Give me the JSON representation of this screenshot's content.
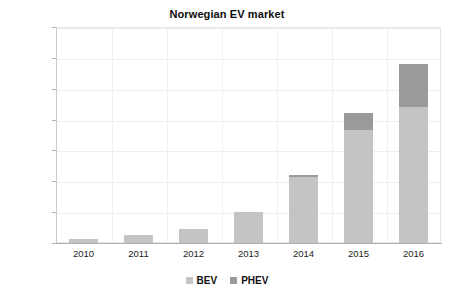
{
  "chart_data": {
    "type": "bar",
    "title": "Norwegian EV market",
    "xlabel": "",
    "ylabel": "",
    "categories": [
      "2010",
      "2011",
      "2012",
      "2013",
      "2014",
      "2015",
      "2016"
    ],
    "series": [
      {
        "name": "BEV",
        "color": "#c4c4c4",
        "values": [
          2900,
          5000,
          9000,
          19800,
          42500,
          73000,
          88000
        ]
      },
      {
        "name": "PHEV",
        "color": "#9a9a9a",
        "values": [
          0,
          0,
          0,
          200,
          1500,
          11000,
          28000
        ]
      }
    ],
    "stacked": true,
    "ylim": [
      0,
      140000
    ],
    "yticks": [
      0,
      20000,
      40000,
      60000,
      80000,
      100000,
      120000,
      140000
    ],
    "ytick_labels": [
      "0",
      "20,000",
      "40,000",
      "60,000",
      "80,000",
      "100,000",
      "120,000",
      "140,000"
    ],
    "grid": true,
    "legend_position": "bottom"
  },
  "legend": {
    "items": [
      {
        "label": "BEV",
        "color": "#c4c4c4"
      },
      {
        "label": "PHEV",
        "color": "#9a9a9a"
      }
    ]
  }
}
